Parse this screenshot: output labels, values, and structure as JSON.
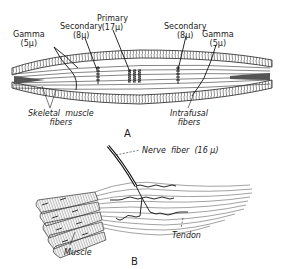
{
  "figure": {
    "panel_a": {
      "letter": "A",
      "labels": {
        "primary": {
          "name": "Primary",
          "size": "(17μ)"
        },
        "secondary_left": {
          "name": "Secondary",
          "size": "(8μ)"
        },
        "gamma_left": {
          "name": "Gamma",
          "size": "(5μ)"
        },
        "secondary_right": {
          "name": "Secondary",
          "size": "(8μ)"
        },
        "gamma_right": {
          "name": "Gamma",
          "size": "(5μ)"
        },
        "skeletal_muscle": {
          "line1": "Skeletal  muscle",
          "line2": "fibers"
        },
        "intrafusal": {
          "line1": "Intrafusal",
          "line2": "fibers"
        }
      }
    },
    "panel_b": {
      "letter": "B",
      "labels": {
        "nerve_fiber": "Nerve  fiber  (16 μ)",
        "muscle": "Muscle",
        "tendon": "Tendon"
      }
    },
    "colors": {
      "ink": "#1a1a1a",
      "background": "#ffffff"
    }
  }
}
